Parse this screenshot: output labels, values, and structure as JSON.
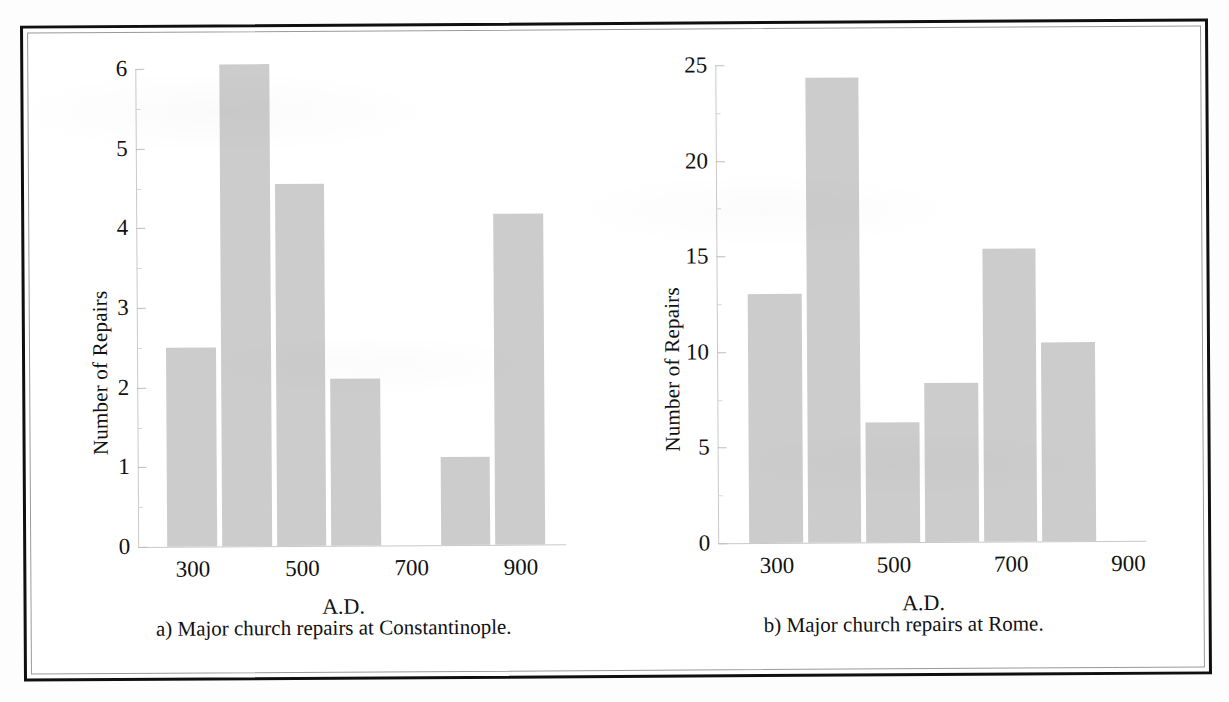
{
  "figure": {
    "panels": [
      {
        "id": "a",
        "caption": "a) Major church repairs at Constantinople.",
        "ylabel": "Number of Repairs",
        "xlabel": "A.D."
      },
      {
        "id": "b",
        "caption": "b) Major church repairs at Rome.",
        "ylabel": "Number of Repairs",
        "xlabel": "A.D."
      }
    ]
  },
  "chart_data": [
    {
      "type": "bar",
      "title": "a) Major church repairs at Constantinople.",
      "xlabel": "A.D.",
      "ylabel": "Number of Repairs",
      "categories": [
        "300",
        "400",
        "500",
        "600",
        "700",
        "800",
        "900"
      ],
      "values": [
        2.5,
        6.05,
        4.55,
        2.1,
        0,
        1.1,
        4.15
      ],
      "xtick_labels": [
        "300",
        "500",
        "700",
        "900"
      ],
      "xtick_categories": [
        "300",
        "500",
        "700",
        "900"
      ],
      "ytick_labels": [
        "0",
        "1",
        "2",
        "3",
        "4",
        "5",
        "6"
      ],
      "ylim": [
        0,
        6
      ],
      "xlim": [
        250,
        1000
      ],
      "grid": false,
      "legend": "none",
      "bar_color": "#cccccc"
    },
    {
      "type": "bar",
      "title": "b) Major church repairs at Rome.",
      "xlabel": "A.D.",
      "ylabel": "Number of Repairs",
      "categories": [
        "300",
        "400",
        "500",
        "600",
        "700",
        "800"
      ],
      "values": [
        13,
        24.3,
        6.3,
        8.3,
        15.3,
        10.4
      ],
      "xtick_labels": [
        "300",
        "500",
        "700",
        "900"
      ],
      "xtick_categories": [
        "300",
        "500",
        "700",
        "900"
      ],
      "ytick_labels": [
        "0",
        "5",
        "10",
        "15",
        "20",
        "25"
      ],
      "ylim": [
        0,
        25
      ],
      "xlim": [
        250,
        950
      ],
      "grid": false,
      "legend": "none",
      "bar_color": "#cccccc"
    }
  ]
}
